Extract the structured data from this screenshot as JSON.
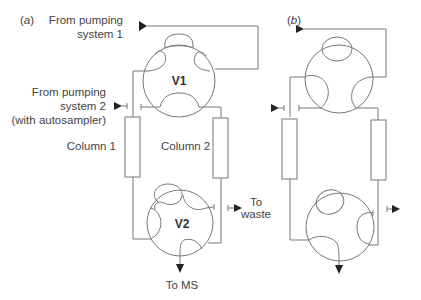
{
  "panels": [
    {
      "id": "a",
      "label": "(a)",
      "labels": {
        "inlet1_line1": "From pumping",
        "inlet1_line2": "system 1",
        "inlet2_line1": "From pumping",
        "inlet2_line2": "system 2",
        "inlet2_line3": "(with autosampler)",
        "column1": "Column 1",
        "column2": "Column 2",
        "valve1": "V1",
        "valve2": "V2",
        "waste_line1": "To",
        "waste_line2": "waste",
        "ms": "To MS"
      }
    },
    {
      "id": "b",
      "label": "(b)"
    }
  ],
  "colors": {
    "line": "#777777",
    "arrow": "#222222",
    "text": "#444444"
  }
}
